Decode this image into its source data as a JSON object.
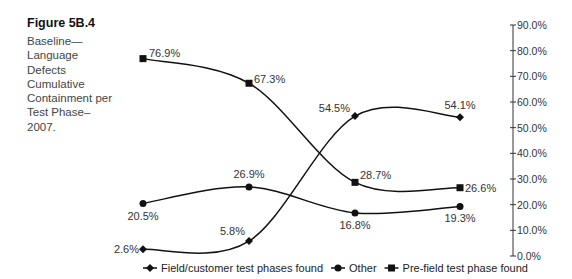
{
  "figure": {
    "label": "Figure 5B.4",
    "caption": "Baseline—Language Defects Cumulative Containment per Test Phase–2007."
  },
  "chart_data": {
    "type": "line",
    "title": "Baseline—Language Defects Cumulative Containment per Test Phase–2007.",
    "xlabel": "",
    "ylabel": "",
    "categories": [
      "Phase 1",
      "Phase 2",
      "Phase 3",
      "Phase 4"
    ],
    "ylim": [
      0,
      90
    ],
    "yticks": [
      "0.0%",
      "10.0%",
      "20.0%",
      "30.0%",
      "40.0%",
      "50.0%",
      "60.0%",
      "70.0%",
      "80.0%",
      "90.0%"
    ],
    "y_axis_position": "right",
    "grid": false,
    "legend_position": "bottom",
    "series": [
      {
        "name": "Field/customer test phases found",
        "marker": "diamond",
        "values": [
          2.6,
          5.8,
          54.5,
          54.1
        ],
        "labels": [
          "2.6%",
          "5.8%",
          "54.5%",
          "54.1%"
        ]
      },
      {
        "name": "Other",
        "marker": "circle",
        "values": [
          20.5,
          26.9,
          16.8,
          19.3
        ],
        "labels": [
          "20.5%",
          "26.9%",
          "16.8%",
          "19.3%"
        ]
      },
      {
        "name": "Pre-field test phase found",
        "marker": "square",
        "values": [
          76.9,
          67.3,
          28.7,
          26.6
        ],
        "labels": [
          "76.9%",
          "67.3%",
          "28.7%",
          "26.6%"
        ]
      }
    ]
  }
}
